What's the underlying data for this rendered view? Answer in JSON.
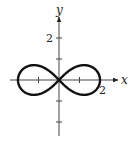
{
  "chart_data": {
    "type": "line",
    "title": "",
    "curve": "lemniscate",
    "equation_hint": "r^2 = 4 cos(2θ)",
    "xlabel": "x",
    "ylabel": "y",
    "x_tick_labels": [
      {
        "value": 2,
        "label": "2"
      }
    ],
    "y_tick_labels": [
      {
        "value": 2,
        "label": "2"
      }
    ],
    "x_ticks": [
      -1,
      1
    ],
    "y_ticks": [
      -2,
      -1,
      1,
      2
    ],
    "xlim": [
      -2.4,
      2.9
    ],
    "ylim": [
      -2.8,
      3.0
    ],
    "grid": false,
    "legend": null,
    "series": [
      {
        "name": "lemniscate",
        "color": "#111111",
        "x_extent": [
          -2,
          2
        ],
        "y_extent": [
          -0.707,
          0.707
        ],
        "points": [
          [
            2,
            0
          ],
          [
            1.9,
            0.31
          ],
          [
            1.73,
            0.5
          ],
          [
            1.5,
            0.62
          ],
          [
            1.22,
            0.7
          ],
          [
            1,
            0.7
          ],
          [
            0.71,
            0.61
          ],
          [
            0.45,
            0.4
          ],
          [
            0,
            0
          ],
          [
            -0.45,
            -0.4
          ],
          [
            -0.71,
            -0.61
          ],
          [
            -1,
            -0.7
          ],
          [
            -1.22,
            -0.7
          ],
          [
            -1.5,
            -0.62
          ],
          [
            -1.73,
            -0.5
          ],
          [
            -1.9,
            -0.31
          ],
          [
            -2,
            0
          ],
          [
            -1.9,
            0.31
          ],
          [
            -1.73,
            0.5
          ],
          [
            -1.5,
            0.62
          ],
          [
            -1.22,
            0.7
          ],
          [
            -1,
            0.7
          ],
          [
            -0.71,
            0.61
          ],
          [
            -0.45,
            0.4
          ],
          [
            0,
            0
          ],
          [
            0.45,
            -0.4
          ],
          [
            0.71,
            -0.61
          ],
          [
            1,
            -0.7
          ],
          [
            1.22,
            -0.7
          ],
          [
            1.5,
            -0.62
          ],
          [
            1.73,
            -0.5
          ],
          [
            1.9,
            -0.31
          ],
          [
            2,
            0
          ]
        ]
      }
    ]
  },
  "labels": {
    "x_axis": "x",
    "y_axis": "y",
    "x_tick_2": "2",
    "y_tick_2": "2"
  }
}
